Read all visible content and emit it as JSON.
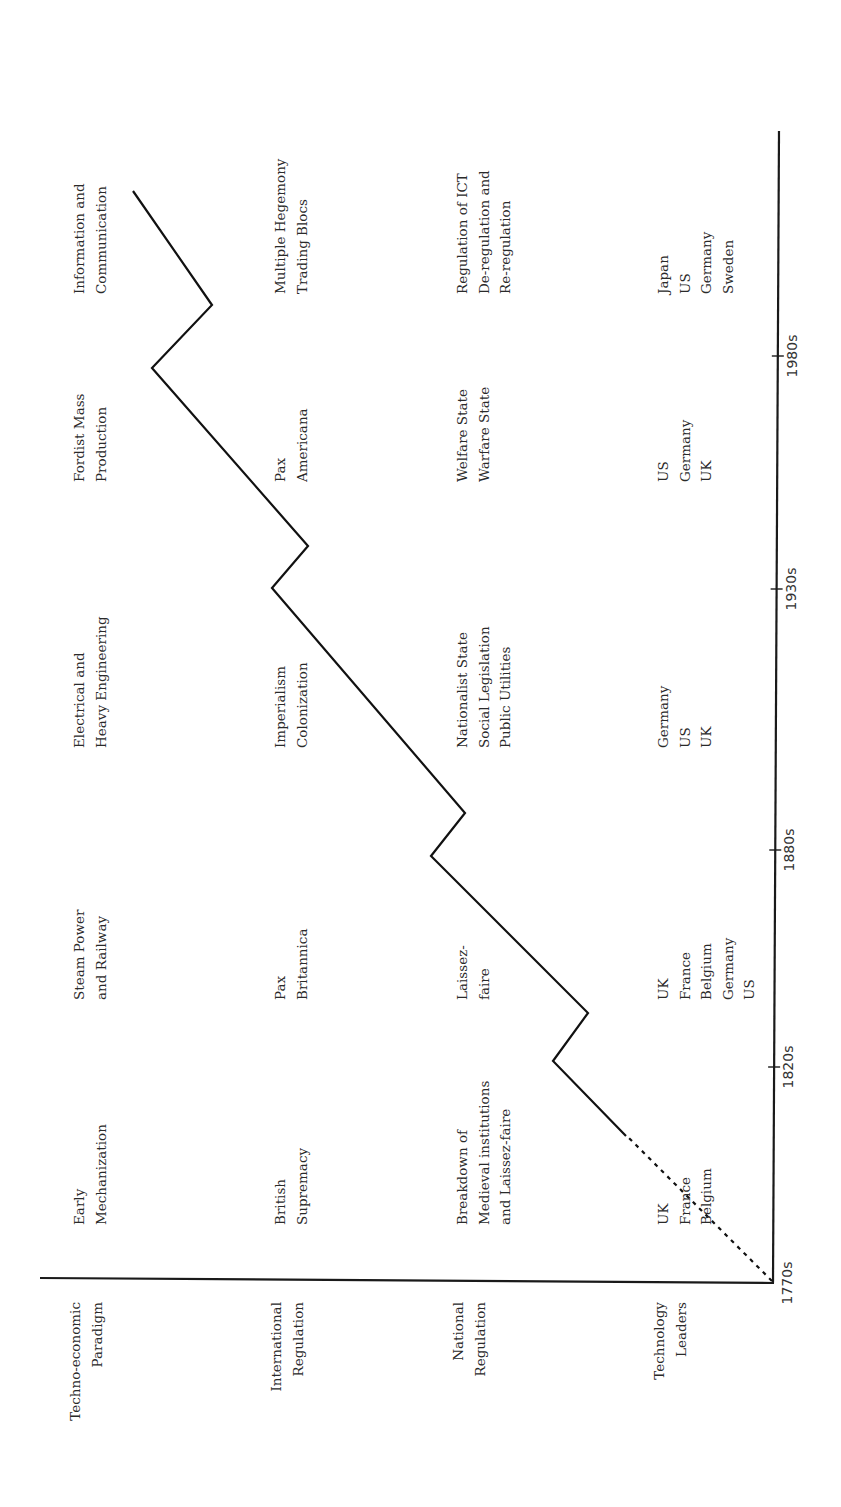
{
  "figure": {
    "orientation": "rotated-90-ccw",
    "row_headers": [
      {
        "id": "paradigm",
        "lines": [
          "Techno-economic",
          "Paradigm"
        ]
      },
      {
        "id": "international",
        "lines": [
          "International",
          "Regulation"
        ]
      },
      {
        "id": "national",
        "lines": [
          "National",
          "Regulation"
        ]
      },
      {
        "id": "leaders",
        "lines": [
          "Technology",
          "Leaders"
        ]
      }
    ],
    "periods": [
      {
        "paradigm": [
          "Early",
          "Mechanization"
        ],
        "international": [
          "British",
          "Supremacy"
        ],
        "national": [
          "Breakdown of",
          "Medieval institutions",
          "and Laissez-faire"
        ],
        "leaders": [
          "UK",
          "France",
          "Belgium"
        ]
      },
      {
        "paradigm": [
          "Steam Power",
          "and Railway"
        ],
        "international": [
          "Pax",
          "Britannica"
        ],
        "national": [
          "Laissez-",
          "faire"
        ],
        "leaders": [
          "UK",
          "France",
          "Belgium",
          "Germany",
          "US"
        ]
      },
      {
        "paradigm": [
          "Electrical and",
          "Heavy Engineering"
        ],
        "international": [
          "Imperialism",
          "Colonization"
        ],
        "national": [
          "Nationalist State",
          "Social Legislation",
          "Public Utilities"
        ],
        "leaders": [
          "Germany",
          "US",
          "UK"
        ]
      },
      {
        "paradigm": [
          "Fordist Mass",
          "Production"
        ],
        "international": [
          "Pax",
          "Americana"
        ],
        "national": [
          "Welfare State",
          "Warfare State"
        ],
        "leaders": [
          "US",
          "Germany",
          "UK"
        ]
      },
      {
        "paradigm": [
          "Information and",
          "Communication"
        ],
        "international": [
          "Multiple Hegemony",
          "Trading Blocs"
        ],
        "national": [
          "Regulation of ICT",
          "De-regulation and",
          "Re-regulation"
        ],
        "leaders": [
          "Japan",
          "US",
          "Germany",
          "Sweden"
        ]
      }
    ],
    "time_axis": {
      "ticks": [
        "1770s",
        "1820s",
        "1880s",
        "1930s",
        "1980s"
      ]
    }
  },
  "chart_data": {
    "type": "line",
    "title": "",
    "xlabel": "",
    "ylabel": "",
    "x_ticks": [
      "1770s",
      "1820s",
      "1880s",
      "1930s",
      "1980s"
    ],
    "series": [
      {
        "name": "long-wave",
        "style": "dashed-then-solid",
        "points_dashed": [
          [
            1770,
            0
          ],
          [
            1800,
            3.2
          ]
        ],
        "points_solid": [
          [
            1800,
            3.2
          ],
          [
            1820,
            4.9
          ],
          [
            1830,
            4.1
          ],
          [
            1880,
            7.7
          ],
          [
            1890,
            6.9
          ],
          [
            1930,
            10.6
          ],
          [
            1940,
            9.7
          ],
          [
            1980,
            13.1
          ],
          [
            1990,
            11.8
          ],
          [
            2015,
            14.5
          ]
        ]
      }
    ],
    "waves": [
      {
        "paradigm": "Early Mechanization",
        "peak": "1820s"
      },
      {
        "paradigm": "Steam Power and Railway",
        "peak": "1880s"
      },
      {
        "paradigm": "Electrical and Heavy Engineering",
        "peak": "1930s"
      },
      {
        "paradigm": "Fordist Mass Production",
        "peak": "1980s"
      },
      {
        "paradigm": "Information and Communication",
        "peak": ""
      }
    ],
    "grid": false,
    "legend": "none"
  }
}
